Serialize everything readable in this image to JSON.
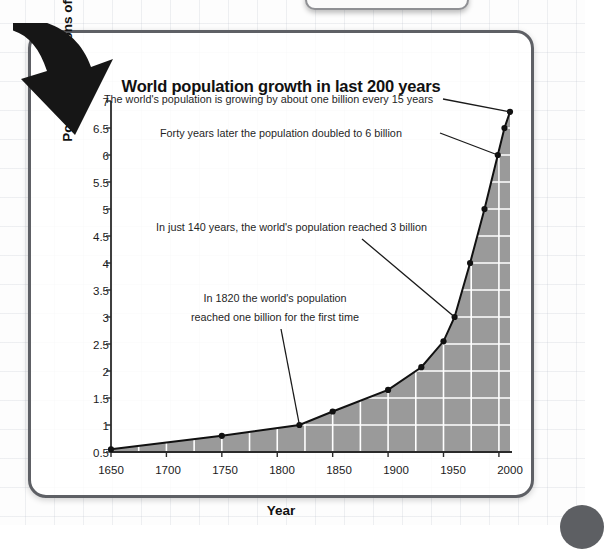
{
  "page": {
    "corner_dot_color": "#5d5f63",
    "panel_border_color": "#5e6065"
  },
  "decorations": {
    "arrow_icon": "curved-down-arrow",
    "top_box_label": "",
    "corner_dot_label": ""
  },
  "chart_data": {
    "type": "area",
    "title": "World population growth in last 200 years",
    "xlabel": "Year",
    "ylabel": "Population (billions of people)",
    "xlim": [
      1650,
      2010
    ],
    "ylim": [
      0.5,
      7
    ],
    "grid": true,
    "legend": "none",
    "fill_color": "#9a9a9a",
    "line_color": "#111111",
    "x_ticks": [
      1650,
      1700,
      1750,
      1800,
      1850,
      1900,
      1950,
      2000
    ],
    "y_ticks": [
      0.5,
      1,
      1.5,
      2,
      2.5,
      3,
      3.5,
      4,
      4.5,
      5,
      5.5,
      6,
      6.5,
      7
    ],
    "x": [
      1650,
      1750,
      1820,
      1850,
      1900,
      1930,
      1950,
      1960,
      1974,
      1987,
      1999,
      2005,
      2010
    ],
    "values": [
      0.55,
      0.8,
      1.0,
      1.25,
      1.65,
      2.07,
      2.55,
      3.0,
      4.0,
      5.0,
      6.0,
      6.5,
      6.8
    ],
    "annotations": [
      {
        "id": "annotation-15-years",
        "text": "The world's population is growing by about one billion every 15 years",
        "target_year": 2010,
        "target_value": 6.8
      },
      {
        "id": "annotation-6-billion",
        "text": "Forty years later the population doubled to 6 billion",
        "target_year": 1999,
        "target_value": 6.0
      },
      {
        "id": "annotation-3-billion",
        "text": "In just 140 years, the world's population reached 3 billion",
        "target_year": 1960,
        "target_value": 3.0
      },
      {
        "id": "annotation-one-billion",
        "line1": "In 1820 the world's population",
        "line2": "reached one billion for the first time",
        "target_year": 1820,
        "target_value": 1.0
      }
    ]
  }
}
